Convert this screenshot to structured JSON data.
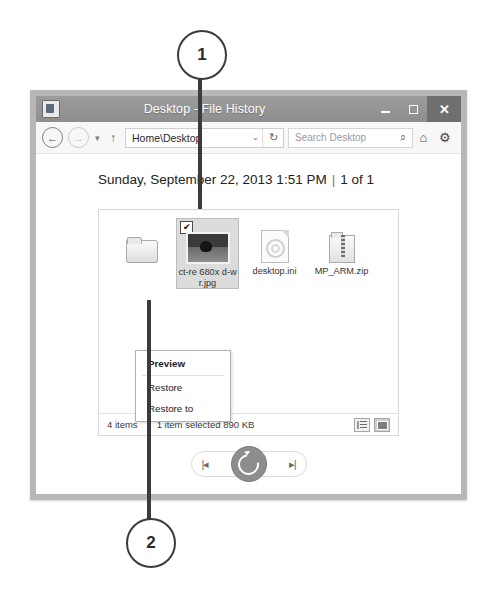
{
  "callouts": [
    {
      "number": "1",
      "target": "selected-file-thumbnail"
    },
    {
      "number": "2",
      "target": "context-menu-restore-to"
    }
  ],
  "window": {
    "title": "Desktop - File History",
    "app_icon": "file-history-icon",
    "controls": {
      "minimize": "–",
      "maximize": "□",
      "close": "✕"
    },
    "toolbar": {
      "back_icon": "←",
      "forward_icon": "→",
      "history_dropdown_icon": "▾",
      "up_icon": "↑",
      "address_value": "Home\\Desktop",
      "address_dropdown_icon": "⌄",
      "refresh_icon": "↻",
      "search_placeholder": "Search Desktop",
      "search_icon": "⌕",
      "home_icon": "⌂",
      "settings_icon": "⚙"
    },
    "date_header": {
      "date": "Sunday, September 22, 2013 1:51 PM",
      "separator": "|",
      "position": "1 of 1"
    },
    "files": [
      {
        "name": "",
        "icon": "folder-icon",
        "selected": false,
        "checked": false
      },
      {
        "name": "ct-re 680x d-w r.jpg",
        "icon": "photo-thumbnail",
        "selected": true,
        "checked": true,
        "check_glyph": "✔"
      },
      {
        "name": "desktop.ini",
        "icon": "ini-document-icon",
        "selected": false,
        "checked": false
      },
      {
        "name": "MP_ARM.zip",
        "icon": "zip-archive-icon",
        "selected": false,
        "checked": false
      }
    ],
    "statusbar": {
      "item_count": "4 items",
      "selection": "1 item selected  890 KB",
      "view_details_icon": "details-view-icon",
      "view_tiles_icon": "large-icons-view-icon"
    },
    "playback": {
      "previous_label": "|◂",
      "next_label": "▸|",
      "restore_label": "restore-icon"
    }
  },
  "context_menu": {
    "items": [
      {
        "label": "Preview",
        "bold": true
      },
      {
        "label": "Restore",
        "bold": false
      },
      {
        "label": "Restore to",
        "bold": false
      }
    ]
  },
  "colors": {
    "titlebar": "#949494",
    "window_frame": "#b7b7b7",
    "selection": "#dcdcdc",
    "restore_button": "#8d8d8d",
    "callout_stroke": "#3b3b3b"
  }
}
